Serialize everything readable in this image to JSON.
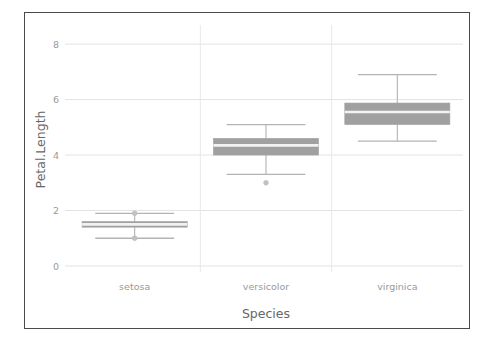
{
  "figure": {
    "border_color": "#4a4a4a",
    "background": "#ffffff"
  },
  "chart_data": {
    "type": "box",
    "title": "",
    "xlabel": "Species",
    "ylabel": "Petal.Length",
    "categories": [
      "setosa",
      "versicolor",
      "virginica"
    ],
    "ylim": [
      0,
      8.4
    ],
    "yticks": [
      0,
      2,
      4,
      6,
      8
    ],
    "ytick_labels": [
      "0",
      "2",
      "4",
      "6",
      "8"
    ],
    "grid": "horizontal-and-vertical",
    "legend": "none",
    "box_fill_color": "#a0a0a0",
    "median_color": "#f2f2f2",
    "whisker_color": "#b3b3b3",
    "outlier_color": "#c2c2c2",
    "boxes": [
      {
        "category": "setosa",
        "whisker_low": 1.0,
        "q1": 1.4,
        "median": 1.5,
        "q3": 1.6,
        "whisker_high": 1.9,
        "outliers": [
          1.0,
          1.9
        ]
      },
      {
        "category": "versicolor",
        "whisker_low": 3.3,
        "q1": 4.0,
        "median": 4.35,
        "q3": 4.6,
        "whisker_high": 5.1,
        "outliers": [
          3.0
        ]
      },
      {
        "category": "virginica",
        "whisker_low": 4.5,
        "q1": 5.1,
        "median": 5.55,
        "q3": 5.875,
        "whisker_high": 6.9,
        "outliers": []
      }
    ]
  }
}
